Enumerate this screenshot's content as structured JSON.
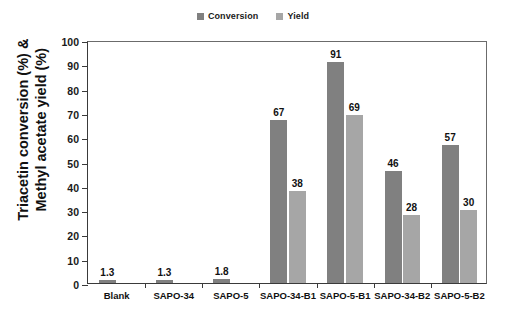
{
  "chart_data": {
    "type": "bar",
    "title": "",
    "xlabel": "",
    "ylabel": "Triacetin conversion (%) & Methyl acetate yield (%)",
    "ylim": [
      0,
      100
    ],
    "yticks": [
      0,
      10,
      20,
      30,
      40,
      50,
      60,
      70,
      80,
      90,
      100
    ],
    "grid": false,
    "legend_position": "top-center",
    "categories": [
      "Blank",
      "SAPO-34",
      "SAPO-5",
      "SAPO-34-B1",
      "SAPO-5-B1",
      "SAPO-34-B2",
      "SAPO-5-B2"
    ],
    "series": [
      {
        "name": "Conversion",
        "color": "#808080",
        "values": [
          1.3,
          1.3,
          1.8,
          67,
          91,
          46,
          57
        ],
        "labels": [
          "1.3",
          "1.3",
          "1.8",
          "67",
          "91",
          "46",
          "57"
        ]
      },
      {
        "name": "Yield",
        "color": "#a6a6a6",
        "values": [
          0,
          0,
          0,
          38,
          69,
          28,
          30
        ],
        "labels": [
          "",
          "",
          "",
          "38",
          "69",
          "28",
          "30"
        ]
      }
    ]
  },
  "ylabel_lines": {
    "line1": "Triacetin conversion (%) &",
    "line2": "Methyl acetate yield (%)"
  }
}
